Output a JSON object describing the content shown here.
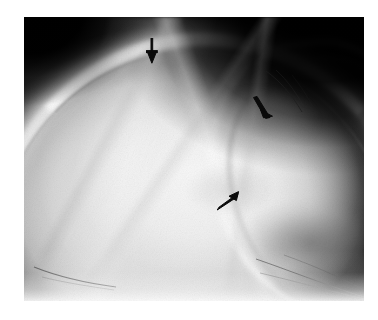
{
  "figure": {
    "kind": "radiograph",
    "modality": "plain film X-ray",
    "view": "lateral skull (calvarium)",
    "caption": "",
    "colors": {
      "page_background": "#ffffff",
      "film_background_dark": "#050505",
      "bone_bright": "#f4f4f4",
      "soft_tissue_mid": "#b4b4b4",
      "arrow": "#0a0a0a"
    },
    "plate": {
      "x": 24,
      "y": 17,
      "width": 340,
      "height": 284
    }
  },
  "annotations": {
    "arrows": [
      {
        "id": "arrow-1",
        "label": "arrow-1",
        "direction": "down",
        "target": "superior calvarial lucency",
        "x": 152,
        "y": 63
      },
      {
        "id": "arrow-2",
        "label": "arrow-2",
        "direction": "down-right",
        "target": "posterior parietal lucency",
        "x": 268,
        "y": 117
      },
      {
        "id": "arrow-3",
        "label": "arrow-3",
        "direction": "up-right",
        "target": "mid parietal lucency",
        "x": 236,
        "y": 193
      }
    ],
    "count": 3
  }
}
